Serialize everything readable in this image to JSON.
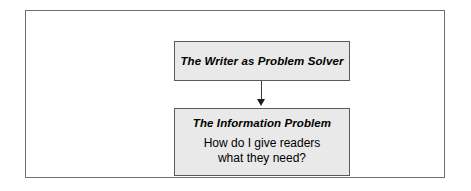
{
  "figure": {
    "type": "flowchart",
    "orientation": "vertical",
    "frame": {
      "style": "thin-ruled-rectangle"
    },
    "nodes": [
      {
        "id": "writer",
        "title": "The Writer as Problem Solver",
        "body": []
      },
      {
        "id": "information",
        "title": "The Information Problem",
        "body": [
          "How do I give readers",
          "what they need?"
        ]
      }
    ],
    "connectors": [
      {
        "id": "writer-to-information",
        "from": "writer",
        "to": "information",
        "arrow": "down-arrow-icon"
      }
    ],
    "colors": {
      "node_fill": "#e9e9e9",
      "node_border": "#5a5a5a",
      "frame_border": "#6e6e6e",
      "text": "#000000",
      "connector": "#3c3c3c",
      "background": "#ffffff"
    }
  }
}
